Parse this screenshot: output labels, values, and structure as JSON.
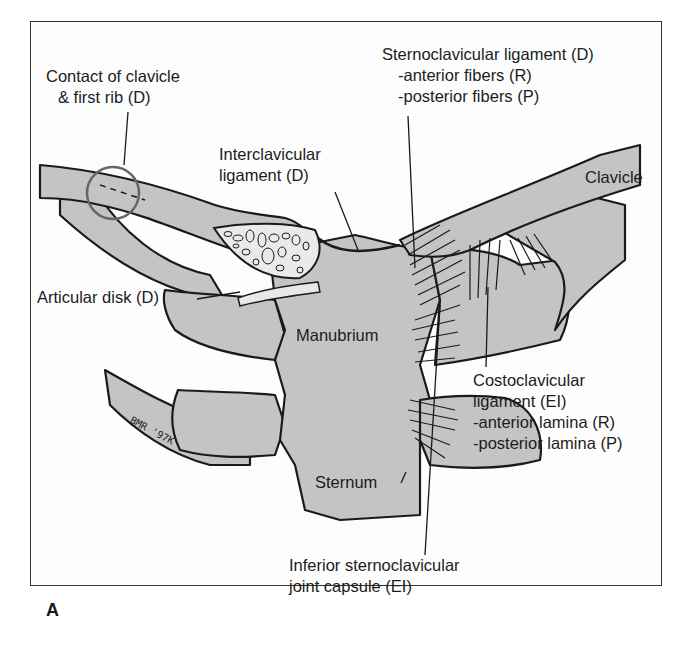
{
  "figure": {
    "panel_letter": "A",
    "artist_signature": "BMR '97K",
    "colors": {
      "bone_fill": "#c4c4c4",
      "outline": "#1a1a1a",
      "frame": "#333333",
      "background": "#ffffff"
    }
  },
  "labels": {
    "contact_clavicle_first_rib": [
      "Contact of clavicle",
      "& first rib (D)"
    ],
    "sternoclavicular_ligament": [
      "Sternoclavicular ligament (D)",
      "-anterior fibers (R)",
      "-posterior fibers (P)"
    ],
    "interclavicular_ligament": [
      "Interclavicular",
      "ligament (D)"
    ],
    "clavicle": "Clavicle",
    "articular_disk": "Articular disk (D)",
    "manubrium": "Manubrium",
    "costoclavicular_ligament": [
      "Costoclavicular",
      "ligament (EI)",
      "-anterior lamina (R)",
      "-posterior lamina (P)"
    ],
    "sternum": "Sternum",
    "inferior_capsule": [
      "Inferior sternoclavicular",
      "joint capsule (EI)"
    ]
  }
}
